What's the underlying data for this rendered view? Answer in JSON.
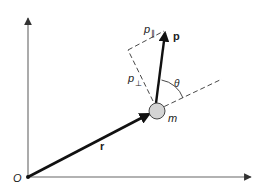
{
  "diagram": {
    "type": "vector-diagram",
    "origin_label": "O",
    "position_vector_label": "r",
    "momentum_vector_label": "p",
    "parallel_component_label": "p",
    "parallel_subscript": "∥",
    "perpendicular_component_label": "p",
    "perpendicular_subscript": "⊥",
    "angle_label": "θ",
    "mass_label": "m",
    "colors": {
      "axis": "#555555",
      "vector": "#111111",
      "dashed": "#333333",
      "mass_fill": "#d4d4d4",
      "mass_stroke": "#333333"
    }
  }
}
